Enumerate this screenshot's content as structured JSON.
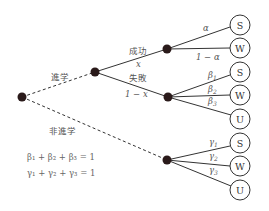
{
  "diagram": {
    "type": "probability-tree",
    "nodes": {
      "root": {
        "x": 22,
        "y": 97
      },
      "advance": {
        "x": 95,
        "y": 72
      },
      "success": {
        "x": 167,
        "y": 49
      },
      "failure": {
        "x": 168,
        "y": 97
      },
      "no_advance": {
        "x": 167,
        "y": 160
      }
    },
    "branches": {
      "advance_label": "進学",
      "no_advance_label": "非進学",
      "success_label": "成功",
      "success_prob": "x",
      "failure_label": "失敗",
      "failure_prob": "1 − x"
    },
    "success_leaves": [
      {
        "label": "S",
        "prob": "α",
        "y": 25
      },
      {
        "label": "W",
        "prob": "1 − α",
        "y": 48
      }
    ],
    "failure_leaves": [
      {
        "label": "S",
        "prob": "β",
        "sub": "1",
        "y": 72
      },
      {
        "label": "W",
        "prob": "β",
        "sub": "2",
        "y": 95
      },
      {
        "label": "U",
        "prob": "β",
        "sub": "3",
        "y": 119
      }
    ],
    "no_advance_leaves": [
      {
        "label": "S",
        "prob": "γ",
        "sub": "1",
        "y": 143
      },
      {
        "label": "W",
        "prob": "γ",
        "sub": "2",
        "y": 166
      },
      {
        "label": "U",
        "prob": "γ",
        "sub": "3",
        "y": 190
      }
    ],
    "equations": {
      "beta": "β₁ + β₂ + β₃ = 1",
      "gamma": "γ₁ + γ₂ + γ₃ = 1"
    },
    "colors": {
      "node": "#2a1a1a",
      "line": "#333333",
      "text": "#555555"
    }
  }
}
